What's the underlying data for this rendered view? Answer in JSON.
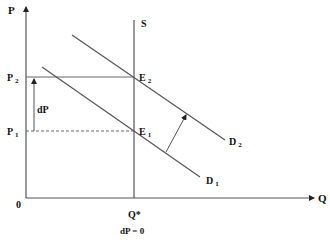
{
  "diagram": {
    "axes": {
      "y_label": "P",
      "x_label": "Q",
      "origin_label": "0"
    },
    "price_labels": {
      "p2": {
        "main": "P",
        "sub": "2"
      },
      "p1": {
        "main": "P",
        "sub": "1"
      }
    },
    "supply_label": "S",
    "equilibria": {
      "e2": {
        "main": "E",
        "sub": "2"
      },
      "e1": {
        "main": "E",
        "sub": "1"
      }
    },
    "demand_labels": {
      "d2": {
        "main": "D",
        "sub": "2"
      },
      "d1": {
        "main": "D",
        "sub": "1"
      }
    },
    "price_change_label": "dP",
    "quantity_label": "Q*",
    "caption": "dP = 0",
    "colors": {
      "line": "#555555",
      "text": "#111111",
      "background": "#ffffff"
    }
  }
}
